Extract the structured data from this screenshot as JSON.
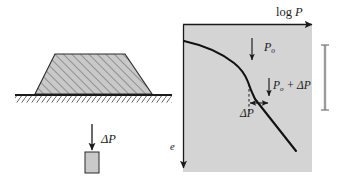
{
  "figure": {
    "background_color": "#ffffff",
    "panel_fill": "#d4d4d4",
    "line_color": "#1a1a1a",
    "fill_color": "#c8c8c8"
  },
  "left_diagram": {
    "name": "embankment-cross-section",
    "embankment": {
      "label": "embankment-trapezoid",
      "hatch_angle_deg": 45,
      "fill": "#c9c9c9",
      "top_left_x": 55,
      "top_right_x": 125,
      "base_left_x": 35,
      "base_right_x": 152,
      "top_y": 54,
      "base_y": 94
    },
    "ground_line": {
      "label": "ground-surface-line",
      "y": 95,
      "x_start": 15,
      "x_end": 172,
      "hatch_label": "ground-hatching"
    },
    "load_block": {
      "label": "load-element-block",
      "x": 85,
      "y": 152,
      "width": 14,
      "height": 21,
      "fill": "#c9c9c9"
    },
    "load_arrow": {
      "label": "delta-P-arrow",
      "x": 92,
      "y_start": 124,
      "y_end": 151
    },
    "delta_p_label": "ΔP"
  },
  "right_diagram": {
    "name": "e-log-p-plot",
    "panel": {
      "left": 183,
      "top": 25,
      "width": 129,
      "height": 147,
      "fill": "#d4d4d4"
    },
    "axes": {
      "x_axis_label": "log P",
      "x_axis_label_parts": {
        "roman": "log ",
        "italic": "P"
      },
      "y_axis_label": "e",
      "x_axis_arrow_y": 24,
      "x_axis_arrow_x_start": 183,
      "x_axis_arrow_x_end": 315,
      "y_axis_arrow_x": 183,
      "y_axis_arrow_y_start": 25,
      "y_axis_arrow_y_end": 172
    },
    "curve": {
      "label": "consolidation-curve",
      "description": "recompression branch flattening then steep virgin compression branch"
    },
    "annotations": [
      {
        "name": "p-o-annotation",
        "text": "P",
        "sub": "o",
        "suffix": "",
        "arrow": "down",
        "x": 264,
        "y": 41
      },
      {
        "name": "p-o-plus-delta-p-annotation",
        "text": "P",
        "sub": "o",
        "suffix": " + ΔP",
        "arrow": "down",
        "x": 273,
        "y": 80
      },
      {
        "name": "delta-p-span-annotation",
        "text": "ΔP",
        "arrow": "double-horizontal",
        "x": 240,
        "y": 108
      }
    ],
    "dashed_line": {
      "label": "p-o-dashed-vertical",
      "x": 249,
      "y_start": 84,
      "y_end": 113
    }
  },
  "right_bar": {
    "name": "scale-bar",
    "x": 325,
    "y_top": 44,
    "y_bottom": 110,
    "color": "#8c8c8c"
  }
}
